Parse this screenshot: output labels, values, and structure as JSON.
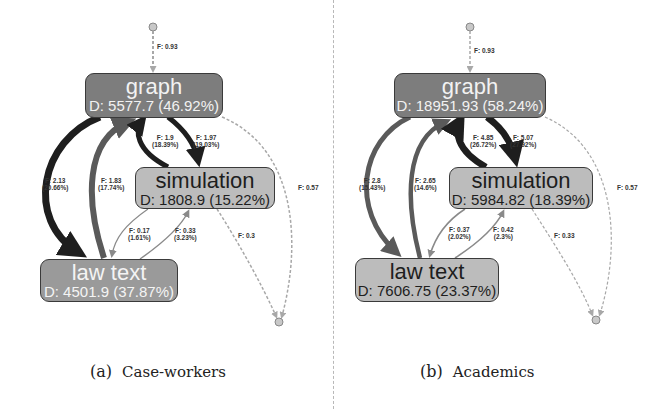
{
  "panels": [
    {
      "tag": "(a)",
      "caption": "Case-workers",
      "nodes": {
        "graph": {
          "label": "graph",
          "duration": "D: 5577.7 (46.92%)"
        },
        "simulation": {
          "label": "simulation",
          "duration": "D: 1808.9 (15.22%)"
        },
        "law_text": {
          "label": "law text",
          "duration": "D: 4501.9 (37.87%)"
        }
      },
      "edges": {
        "start_to_graph": {
          "f": "F: 0.93"
        },
        "graph_to_law": {
          "f": "F: 2.13",
          "pct": "(20.66%)"
        },
        "law_to_graph": {
          "f": "F: 1.83",
          "pct": "(17.74%)"
        },
        "sim_to_graph": {
          "f": "F: 1.9",
          "pct": "(18.39%)"
        },
        "graph_to_sim": {
          "f": "F: 1.97",
          "pct": "(19.03%)"
        },
        "sim_to_law": {
          "f": "F: 0.17",
          "pct": "(1.61%)"
        },
        "law_to_sim": {
          "f": "F: 0.33",
          "pct": "(3.23%)"
        },
        "graph_to_end": {
          "f": "F: 0.57"
        },
        "sim_to_end": {
          "f": "F: 0.3"
        }
      }
    },
    {
      "tag": "(b)",
      "caption": "Academics",
      "nodes": {
        "graph": {
          "label": "graph",
          "duration": "D: 18951.93 (58.24%)"
        },
        "simulation": {
          "label": "simulation",
          "duration": "D: 5984.82 (18.39%)"
        },
        "law_text": {
          "label": "law text",
          "duration": "D: 7606.75 (23.37%)"
        }
      },
      "edges": {
        "start_to_graph": {
          "f": "F: 0.93"
        },
        "graph_to_law": {
          "f": "F: 2.8",
          "pct": "(15.43%)"
        },
        "law_to_graph": {
          "f": "F: 2.65",
          "pct": "(14.6%)"
        },
        "sim_to_graph": {
          "f": "F: 4.85",
          "pct": "(26.72%)"
        },
        "graph_to_sim": {
          "f": "F: 5.07",
          "pct": "(27.92%)"
        },
        "sim_to_law": {
          "f": "F: 0.37",
          "pct": "(2.02%)"
        },
        "law_to_sim": {
          "f": "F: 0.42",
          "pct": "(2.3%)"
        },
        "graph_to_end": {
          "f": "F: 0.57"
        },
        "sim_to_end": {
          "f": "F: 0.33"
        }
      }
    }
  ],
  "colors": {
    "node_dark": "#7d7d7d",
    "node_mid": "#9a9a9a",
    "node_light": "#bcbcbc",
    "edge_heavy": "#1e1e1e",
    "edge_medium": "#5a5a5a",
    "edge_light": "#8a8a8a",
    "edge_dashed": "#a8a8a8"
  }
}
